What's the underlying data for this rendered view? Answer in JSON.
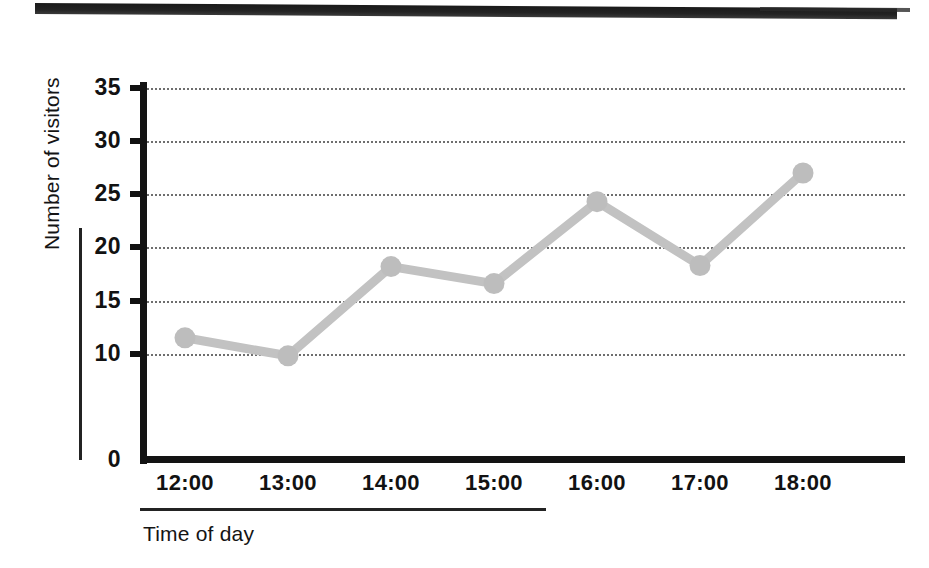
{
  "chart_data": {
    "type": "line",
    "title": "",
    "xlabel": "Time of day",
    "ylabel": "Number of visitors",
    "categories": [
      "12:00",
      "13:00",
      "14:00",
      "15:00",
      "16:00",
      "17:00",
      "18:00"
    ],
    "values": [
      11.5,
      9.8,
      18.2,
      16.6,
      24.3,
      18.3,
      27.0
    ],
    "series": [
      {
        "name": "Number of visitors",
        "values": [
          11.5,
          9.8,
          18.2,
          16.6,
          24.3,
          18.3,
          27.0
        ]
      }
    ],
    "ylim": [
      0,
      35
    ],
    "yticks": [
      0,
      10,
      15,
      20,
      25,
      30,
      35
    ],
    "ytick_labels": [
      "0",
      "10",
      "15",
      "20",
      "25",
      "30",
      "35"
    ],
    "xtick_labels": [
      "12:00",
      "13:00",
      "14:00",
      "15:00",
      "16:00",
      "17:00",
      "18:00"
    ],
    "grid": "horizontal-dotted",
    "legend": "none",
    "line_color": "#c2c2c2",
    "marker_color": "#bdbdbd",
    "axis_color": "#131313",
    "grid_color": "#6e6e6e"
  },
  "axes": {
    "y_title": "Number of visitors",
    "x_title": "Time of day",
    "ticks_y": [
      {
        "label": "35",
        "value": 35
      },
      {
        "label": "30",
        "value": 30
      },
      {
        "label": "25",
        "value": 25
      },
      {
        "label": "20",
        "value": 20
      },
      {
        "label": "15",
        "value": 15
      },
      {
        "label": "10",
        "value": 10
      },
      {
        "label": "0",
        "value": 0
      }
    ],
    "ticks_x": [
      {
        "label": "12:00"
      },
      {
        "label": "13:00"
      },
      {
        "label": "14:00"
      },
      {
        "label": "15:00"
      },
      {
        "label": "16:00"
      },
      {
        "label": "17:00"
      },
      {
        "label": "18:00"
      }
    ]
  },
  "decor": {
    "top_bar": "scan-artifact-bar"
  }
}
